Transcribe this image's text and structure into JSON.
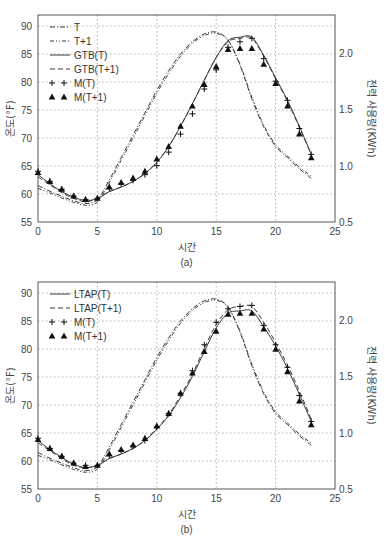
{
  "chart_data": [
    {
      "type": "line",
      "panel": "(a)",
      "caption": "(a)",
      "xlabel": "시간",
      "ylabel": "온도(°F)",
      "y2label": "전력 사용량(KWh)",
      "xlim": [
        0,
        25
      ],
      "ylim": [
        55,
        92
      ],
      "y2lim": [
        0.5,
        2.3
      ],
      "xticks": [
        0,
        5,
        10,
        15,
        20,
        25
      ],
      "yticks": [
        55,
        60,
        65,
        70,
        75,
        80,
        85,
        90
      ],
      "y2ticks": [
        0.5,
        1.0,
        1.5,
        2.0
      ],
      "grid": true,
      "legend_position": "upper left",
      "legend": [
        "T",
        "T+1",
        "GTB(T)",
        "GTB(T+1)",
        "M(T)",
        "M(T+1)"
      ],
      "x": [
        0,
        1,
        2,
        3,
        4,
        5,
        6,
        7,
        8,
        9,
        10,
        11,
        12,
        13,
        14,
        15,
        16,
        17,
        18,
        19,
        20,
        21,
        22,
        23
      ],
      "series": [
        {
          "name": "T",
          "axis": "left",
          "style": "dash-dot",
          "values": [
            61.5,
            60.5,
            59.6,
            58.8,
            58.3,
            59.0,
            62.5,
            66.5,
            70.5,
            74.5,
            78.5,
            82.0,
            85.0,
            87.2,
            88.6,
            88.9,
            87.5,
            83.0,
            77.0,
            72.0,
            68.5,
            66.5,
            64.5,
            62.8
          ]
        },
        {
          "name": "T+1",
          "axis": "left",
          "style": "dash-dot-dot",
          "values": [
            61.0,
            60.2,
            59.3,
            58.5,
            58.0,
            58.6,
            62.0,
            66.0,
            70.0,
            74.0,
            78.0,
            81.5,
            84.6,
            86.9,
            88.3,
            88.7,
            87.4,
            83.2,
            77.3,
            72.3,
            68.8,
            66.8,
            64.8,
            63.2
          ]
        },
        {
          "name": "GTB(T)",
          "axis": "right",
          "style": "solid",
          "values": [
            0.92,
            0.84,
            0.77,
            0.72,
            0.69,
            0.71,
            0.77,
            0.81,
            0.86,
            0.93,
            1.03,
            1.17,
            1.35,
            1.55,
            1.76,
            1.96,
            2.11,
            2.14,
            2.14,
            1.98,
            1.78,
            1.58,
            1.35,
            1.1
          ]
        },
        {
          "name": "GTB(T+1)",
          "axis": "right",
          "style": "dashed",
          "values": [
            0.9,
            0.83,
            0.76,
            0.71,
            0.68,
            0.71,
            0.77,
            0.81,
            0.86,
            0.93,
            1.03,
            1.17,
            1.35,
            1.55,
            1.76,
            1.96,
            2.1,
            2.13,
            2.13,
            1.97,
            1.77,
            1.57,
            1.34,
            1.1
          ]
        },
        {
          "name": "M(T)",
          "axis": "right",
          "style": "plus-markers",
          "values": [
            0.95,
            0.86,
            0.79,
            0.73,
            0.7,
            0.71,
            0.8,
            0.84,
            0.87,
            0.92,
            1.0,
            1.12,
            1.28,
            1.46,
            1.68,
            1.85,
            2.05,
            2.1,
            2.13,
            1.95,
            1.75,
            1.58,
            1.33,
            1.1
          ]
        },
        {
          "name": "M(T+1)",
          "axis": "right",
          "style": "triangle-markers",
          "values": [
            0.94,
            0.86,
            0.79,
            0.73,
            0.7,
            0.71,
            0.81,
            0.85,
            0.89,
            0.95,
            1.06,
            1.17,
            1.35,
            1.53,
            1.72,
            1.88,
            2.03,
            2.04,
            2.04,
            1.9,
            1.73,
            1.53,
            1.28,
            1.07
          ]
        }
      ]
    },
    {
      "type": "line",
      "panel": "(b)",
      "caption": "(b)",
      "xlabel": "시간",
      "ylabel": "온도(°F)",
      "y2label": "전력 사용량(KWh)",
      "xlim": [
        0,
        25
      ],
      "ylim": [
        55,
        92
      ],
      "y2lim": [
        0.5,
        2.3
      ],
      "xticks": [
        0,
        5,
        10,
        15,
        20,
        25
      ],
      "yticks": [
        55,
        60,
        65,
        70,
        75,
        80,
        85,
        90
      ],
      "y2ticks": [
        0.5,
        1.0,
        1.5,
        2.0
      ],
      "grid": true,
      "legend_position": "upper left",
      "legend": [
        "LTAP(T)",
        "LTAP(T+1)",
        "M(T)",
        "M(T+1)"
      ],
      "x": [
        0,
        1,
        2,
        3,
        4,
        5,
        6,
        7,
        8,
        9,
        10,
        11,
        12,
        13,
        14,
        15,
        16,
        17,
        18,
        19,
        20,
        21,
        22,
        23
      ],
      "series": [
        {
          "name": "T",
          "axis": "left",
          "style": "dash-dot",
          "values": [
            61.5,
            60.5,
            59.6,
            58.8,
            58.3,
            59.0,
            62.5,
            66.5,
            70.5,
            74.5,
            78.5,
            82.0,
            85.0,
            87.2,
            88.6,
            88.9,
            87.5,
            83.0,
            77.0,
            72.0,
            68.5,
            66.5,
            64.5,
            62.8
          ]
        },
        {
          "name": "T+1",
          "axis": "left",
          "style": "dash-dot-dot",
          "values": [
            61.0,
            60.2,
            59.3,
            58.5,
            58.0,
            58.6,
            62.0,
            66.0,
            70.0,
            74.0,
            78.0,
            81.5,
            84.6,
            86.9,
            88.3,
            88.7,
            87.4,
            83.2,
            77.3,
            72.3,
            68.8,
            66.8,
            64.8,
            63.2
          ]
        },
        {
          "name": "LTAP(T)",
          "axis": "right",
          "style": "solid",
          "values": [
            0.93,
            0.85,
            0.78,
            0.72,
            0.69,
            0.71,
            0.77,
            0.81,
            0.86,
            0.93,
            1.03,
            1.15,
            1.31,
            1.5,
            1.72,
            1.93,
            2.06,
            2.08,
            2.08,
            1.94,
            1.77,
            1.57,
            1.34,
            1.1
          ]
        },
        {
          "name": "LTAP(T+1)",
          "axis": "right",
          "style": "dashed",
          "values": [
            0.91,
            0.84,
            0.77,
            0.71,
            0.69,
            0.71,
            0.77,
            0.81,
            0.86,
            0.93,
            1.04,
            1.16,
            1.33,
            1.52,
            1.75,
            1.96,
            2.09,
            2.12,
            2.12,
            1.98,
            1.8,
            1.6,
            1.37,
            1.12
          ]
        },
        {
          "name": "M(T)",
          "axis": "right",
          "style": "plus-markers",
          "values": [
            0.95,
            0.86,
            0.79,
            0.73,
            0.71,
            0.71,
            0.8,
            0.84,
            0.88,
            0.93,
            1.05,
            1.17,
            1.35,
            1.55,
            1.78,
            1.98,
            2.1,
            2.12,
            2.13,
            1.95,
            1.78,
            1.58,
            1.33,
            1.1
          ]
        },
        {
          "name": "M(T+1)",
          "axis": "right",
          "style": "triangle-markers",
          "values": [
            0.94,
            0.86,
            0.79,
            0.73,
            0.7,
            0.71,
            0.81,
            0.85,
            0.89,
            0.95,
            1.06,
            1.17,
            1.35,
            1.53,
            1.72,
            1.9,
            2.05,
            2.06,
            2.06,
            1.92,
            1.74,
            1.54,
            1.28,
            1.07
          ]
        }
      ]
    }
  ],
  "styles": {
    "line_color": "#3a3a3a",
    "grid_color": "#9a9a9a",
    "axis_color": "#555555",
    "marker_color": "#111111"
  }
}
